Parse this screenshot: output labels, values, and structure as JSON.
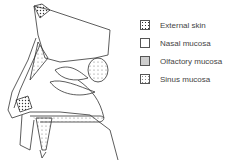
{
  "legend": {
    "items": [
      {
        "label": "External skin",
        "pattern": "dense-dots"
      },
      {
        "label": "Nasal mucosa",
        "pattern": "blank"
      },
      {
        "label": "Olfactory mucosa",
        "pattern": "fine-stipple"
      },
      {
        "label": "Sinus mucosa",
        "pattern": "sparse-dots"
      }
    ]
  },
  "colors": {
    "line": "#333333",
    "background": "#ffffff"
  }
}
